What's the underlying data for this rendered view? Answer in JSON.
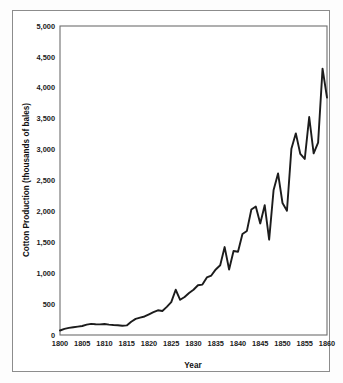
{
  "figure": {
    "background_color": "#ffffff",
    "border_color": "#8c8c8c"
  },
  "chart_data": {
    "type": "line",
    "title": "",
    "xlabel": "Year",
    "ylabel": "Cotton Production (thousands of bales)",
    "xlim": [
      1800,
      1860
    ],
    "ylim": [
      0,
      5000
    ],
    "xticks": [
      1800,
      1805,
      1810,
      1815,
      1820,
      1825,
      1830,
      1835,
      1840,
      1845,
      1850,
      1855,
      1860
    ],
    "xtick_labels": [
      "1800",
      "1805",
      "1810",
      "1815",
      "1820",
      "1825",
      "1830",
      "1835",
      "1840",
      "1845",
      "1850",
      "1855",
      "1860"
    ],
    "yticks": [
      0,
      500,
      1000,
      1500,
      2000,
      2500,
      3000,
      3500,
      4000,
      4500,
      5000
    ],
    "ytick_labels": [
      "0",
      "500",
      "1,000",
      "1,500",
      "2,000",
      "2,500",
      "3,000",
      "3,500",
      "4,000",
      "4,500",
      "5,000"
    ],
    "grid": true,
    "legend": "none",
    "line_color": "#1c1c1c",
    "series": [
      {
        "name": "Cotton Production",
        "x": [
          1800,
          1801,
          1802,
          1803,
          1804,
          1805,
          1806,
          1807,
          1808,
          1809,
          1810,
          1811,
          1812,
          1813,
          1814,
          1815,
          1816,
          1817,
          1818,
          1819,
          1820,
          1821,
          1822,
          1823,
          1824,
          1825,
          1826,
          1827,
          1828,
          1829,
          1830,
          1831,
          1832,
          1833,
          1834,
          1835,
          1836,
          1837,
          1838,
          1839,
          1840,
          1841,
          1842,
          1843,
          1844,
          1845,
          1846,
          1847,
          1848,
          1849,
          1850,
          1851,
          1852,
          1853,
          1854,
          1855,
          1856,
          1857,
          1858,
          1859,
          1860
        ],
        "values": [
          73,
          100,
          115,
          125,
          135,
          146,
          167,
          180,
          175,
          172,
          178,
          168,
          162,
          158,
          150,
          155,
          215,
          260,
          280,
          300,
          335,
          370,
          400,
          388,
          455,
          532,
          732,
          570,
          615,
          680,
          732,
          805,
          816,
          931,
          962,
          1061,
          1128,
          1423,
          1060,
          1360,
          1348,
          1635,
          1684,
          2030,
          2078,
          1805,
          2100,
          1542,
          2348,
          2615,
          2136,
          2010,
          3015,
          3263,
          2930,
          2848,
          3527,
          2940,
          3113,
          4310,
          3841
        ]
      }
    ]
  },
  "plot_geometry": {
    "left": 60,
    "top": 26,
    "right": 327,
    "bottom": 335
  }
}
